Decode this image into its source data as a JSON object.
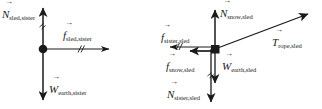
{
  "figure": {
    "type": "free-body-diagrams",
    "background_color": "#ffffff",
    "stroke_color": "#1a1a1a",
    "width": 322,
    "height": 109
  },
  "diagrams": [
    {
      "id": "sister",
      "object": "sister",
      "origin": {
        "x": 43,
        "y": 49
      },
      "origin_marker": "dot",
      "forces": [
        {
          "name": "normal-force-sled-on-sister",
          "symbol": "N",
          "subscript": "sled,sister",
          "direction": "up",
          "label_x": 2,
          "label_y": 5,
          "tip": {
            "x": 43,
            "y": 4
          },
          "has_hash_marks": true
        },
        {
          "name": "friction-force-sled-on-sister",
          "symbol": "f",
          "subscript": "sled,sister",
          "direction": "right",
          "label_x": 63,
          "label_y": 26,
          "tip": {
            "x": 112,
            "y": 49
          },
          "has_hash_marks": true
        },
        {
          "name": "weight-force-earth-on-sister",
          "symbol": "W",
          "subscript": "earth,sister",
          "direction": "down",
          "label_x": 49,
          "label_y": 80,
          "tip": {
            "x": 43,
            "y": 103
          },
          "has_hash_marks": false
        }
      ]
    },
    {
      "id": "sled",
      "object": "sled",
      "origin": {
        "x": 215,
        "y": 49
      },
      "origin_marker": "square",
      "forces": [
        {
          "name": "normal-force-snow-on-sled",
          "symbol": "N",
          "subscript": "snow,sled",
          "direction": "up",
          "label_x": 220,
          "label_y": 4,
          "tip": {
            "x": 215,
            "y": 6
          },
          "has_hash_marks": false
        },
        {
          "name": "tension-force-rope-on-sled",
          "symbol": "T",
          "subscript": "rope,sled",
          "direction": "up-right",
          "label_x": 272,
          "label_y": 33,
          "tip": {
            "x": 312,
            "y": 12
          },
          "angle_degrees": 21,
          "has_hash_marks": false
        },
        {
          "name": "friction-force-sister-on-sled",
          "symbol": "f",
          "subscript": "sister,sled",
          "direction": "left",
          "label_x": 161,
          "label_y": 28,
          "tip": {
            "x": 166,
            "y": 47
          },
          "has_hash_marks": true
        },
        {
          "name": "friction-force-snow-on-sled",
          "symbol": "f",
          "subscript": "snow,sled",
          "direction": "left",
          "label_x": 166,
          "label_y": 57,
          "tip": {
            "x": 186,
            "y": 51
          },
          "has_hash_marks": false
        },
        {
          "name": "weight-force-earth-on-sled",
          "symbol": "W",
          "subscript": "earth,sled",
          "direction": "down",
          "label_x": 222,
          "label_y": 57,
          "tip": {
            "x": 215,
            "y": 86
          },
          "has_hash_marks": false
        },
        {
          "name": "normal-force-sister-on-sled",
          "symbol": "N",
          "subscript": "sister,sled",
          "direction": "down",
          "label_x": 167,
          "label_y": 85,
          "tip": {
            "x": 215,
            "y": 105
          },
          "has_hash_marks": true
        }
      ]
    }
  ],
  "vector_accent": "→"
}
